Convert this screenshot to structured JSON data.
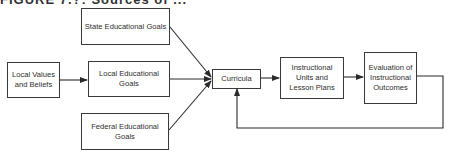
{
  "figure": {
    "title": "FIGURE 7.?: Sources of ..."
  },
  "nodes": {
    "state_goals": {
      "label": "State Educational Goals"
    },
    "local_values": {
      "label": "Local Values and Beliefs"
    },
    "local_goals": {
      "label": "Local Educational Goals"
    },
    "federal_goals": {
      "label": "Federal Educational Goals"
    },
    "curricula": {
      "label": "Curricula"
    },
    "instructional_units": {
      "label": "Instructional Units and Lesson Plans"
    },
    "evaluation": {
      "label": "Evaluation of Instructional Outcomes"
    }
  },
  "edges": [
    {
      "from": "local_values",
      "to": "local_goals"
    },
    {
      "from": "state_goals",
      "to": "curricula"
    },
    {
      "from": "local_goals",
      "to": "curricula"
    },
    {
      "from": "federal_goals",
      "to": "curricula"
    },
    {
      "from": "curricula",
      "to": "instructional_units"
    },
    {
      "from": "instructional_units",
      "to": "evaluation"
    },
    {
      "from": "evaluation",
      "to": "curricula",
      "type": "feedback-loop"
    }
  ],
  "colors": {
    "line": "#2a2a2a",
    "background": "#ffffff"
  }
}
